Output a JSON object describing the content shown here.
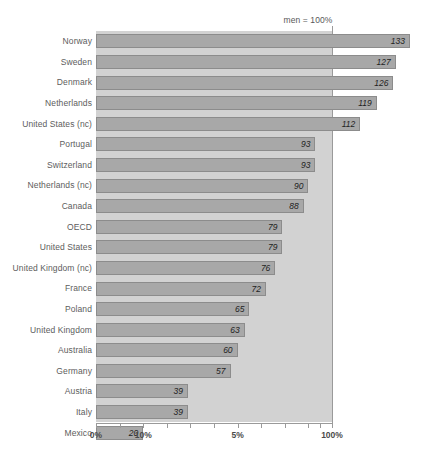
{
  "annotation": {
    "reference_note": "men = 100%"
  },
  "axis": {
    "ticks": [
      {
        "label": "0%",
        "value": 0,
        "show_label": true
      },
      {
        "label": "",
        "value": 10,
        "show_label": false
      },
      {
        "label": "10%",
        "value": 20,
        "show_label": true
      },
      {
        "label": "",
        "value": 30,
        "show_label": false
      },
      {
        "label": "",
        "value": 40,
        "show_label": false
      },
      {
        "label": "",
        "value": 50,
        "show_label": false
      },
      {
        "label": "5%",
        "value": 60,
        "show_label": true
      },
      {
        "label": "",
        "value": 70,
        "show_label": false
      },
      {
        "label": "",
        "value": 80,
        "show_label": false
      },
      {
        "label": "",
        "value": 90,
        "show_label": false
      },
      {
        "label": "",
        "value": 95,
        "show_label": false
      },
      {
        "label": "100%",
        "value": 100,
        "show_label": true
      }
    ]
  },
  "colors": {
    "bar_fill": "#a8a8a8",
    "bar_border": "#8c8c8c",
    "plot_background": "#d2d2d2",
    "axis": "#9a9a9a",
    "label_text": "#5d5d5d",
    "value_text": "#1f1f1f"
  },
  "chart_data": {
    "type": "bar",
    "orientation": "horizontal",
    "title": "",
    "subtitle": "",
    "xlabel": "",
    "ylabel": "",
    "annotation": "men = 100%",
    "grid": false,
    "legend": "none",
    "reference_value": 100,
    "xlim": [
      0,
      135
    ],
    "axis_tick_labels": [
      "0%",
      "10%",
      "5%",
      "100%"
    ],
    "categories": [
      "Norway",
      "Sweden",
      "Denmark",
      "Netherlands",
      "United States (nc)",
      "Portugal",
      "Switzerland",
      "Netherlands (nc)",
      "Canada",
      "OECD",
      "United States",
      "United Kingdom (nc)",
      "France",
      "Poland",
      "United Kingdom",
      "Australia",
      "Germany",
      "Austria",
      "Italy",
      "Mexico"
    ],
    "values": [
      133,
      127,
      126,
      119,
      112,
      93,
      93,
      90,
      88,
      79,
      79,
      76,
      72,
      65,
      63,
      60,
      57,
      39,
      39,
      20
    ]
  }
}
